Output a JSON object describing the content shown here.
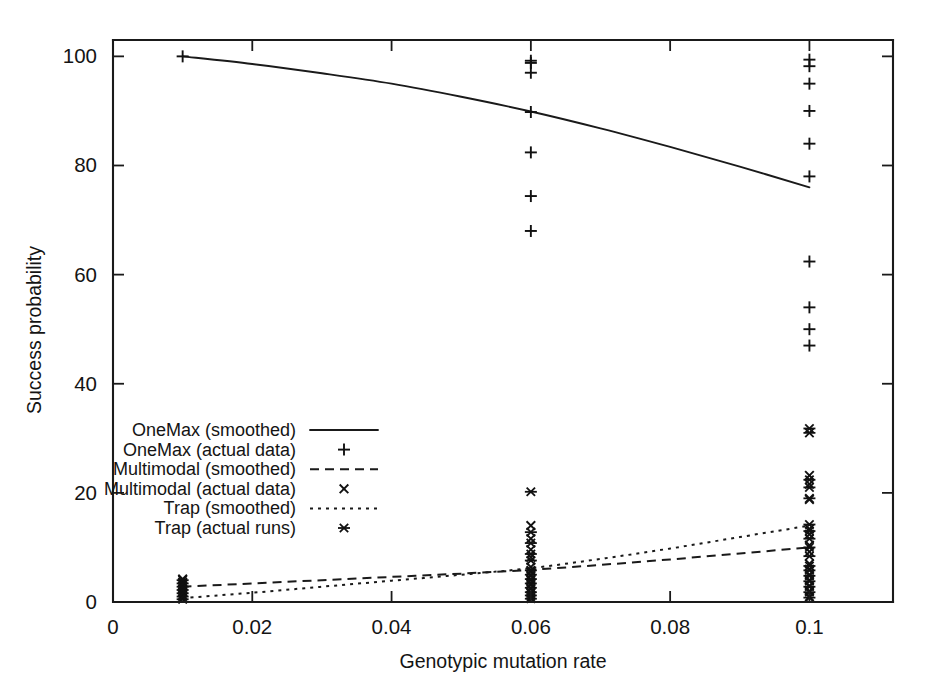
{
  "chart_data": {
    "type": "scatter",
    "title": "",
    "xlabel": "Genotypic mutation rate",
    "ylabel": "Success probability",
    "xlim": [
      0,
      0.112
    ],
    "ylim": [
      0,
      103
    ],
    "grid": false,
    "legend_position": "center-left",
    "xticks": [
      "0",
      "0.02",
      "0.04",
      "0.06",
      "0.08",
      "0.1"
    ],
    "xtick_values": [
      0,
      0.02,
      0.04,
      0.06,
      0.08,
      0.1
    ],
    "yticks": [
      "0",
      "20",
      "40",
      "60",
      "80",
      "100"
    ],
    "ytick_values": [
      0,
      20,
      40,
      60,
      80,
      100
    ],
    "x_levels": [
      0.01,
      0.06,
      0.1
    ],
    "series": [
      {
        "name": "OneMax (smoothed)",
        "style": "solid-line",
        "marker": "line",
        "x": [
          0.01,
          0.02,
          0.03,
          0.04,
          0.05,
          0.06,
          0.07,
          0.08,
          0.09,
          0.1
        ],
        "values": [
          100.0,
          98.6,
          96.9,
          95.0,
          92.6,
          89.9,
          86.8,
          83.4,
          79.8,
          76.0
        ]
      },
      {
        "name": "OneMax (actual data)",
        "style": "points",
        "marker": "plus",
        "points": [
          {
            "x": 0.01,
            "y": 100
          },
          {
            "x": 0.06,
            "y": 99.2
          },
          {
            "x": 0.06,
            "y": 98.8
          },
          {
            "x": 0.06,
            "y": 97.0
          },
          {
            "x": 0.06,
            "y": 89.8
          },
          {
            "x": 0.06,
            "y": 82.4
          },
          {
            "x": 0.06,
            "y": 74.4
          },
          {
            "x": 0.06,
            "y": 68.0
          },
          {
            "x": 0.1,
            "y": 99.4
          },
          {
            "x": 0.1,
            "y": 98.2
          },
          {
            "x": 0.1,
            "y": 95.0
          },
          {
            "x": 0.1,
            "y": 90.0
          },
          {
            "x": 0.1,
            "y": 84.0
          },
          {
            "x": 0.1,
            "y": 78.0
          },
          {
            "x": 0.1,
            "y": 62.4
          },
          {
            "x": 0.1,
            "y": 54.0
          },
          {
            "x": 0.1,
            "y": 50.0
          },
          {
            "x": 0.1,
            "y": 47.0
          }
        ]
      },
      {
        "name": "Multimodal (smoothed)",
        "style": "dashed-line",
        "marker": "line",
        "x": [
          0.01,
          0.02,
          0.03,
          0.04,
          0.05,
          0.06,
          0.07,
          0.08,
          0.09,
          0.1
        ],
        "values": [
          2.8,
          3.4,
          4.0,
          4.6,
          5.2,
          5.9,
          6.8,
          7.8,
          8.9,
          10.0
        ]
      },
      {
        "name": "Multimodal (actual data)",
        "style": "points",
        "marker": "cross",
        "points": [
          {
            "x": 0.01,
            "y": 0.6
          },
          {
            "x": 0.01,
            "y": 1.2
          },
          {
            "x": 0.01,
            "y": 1.8
          },
          {
            "x": 0.01,
            "y": 2.4
          },
          {
            "x": 0.01,
            "y": 3.0
          },
          {
            "x": 0.01,
            "y": 3.6
          },
          {
            "x": 0.01,
            "y": 4.2
          },
          {
            "x": 0.06,
            "y": 0.8
          },
          {
            "x": 0.06,
            "y": 1.6
          },
          {
            "x": 0.06,
            "y": 2.4
          },
          {
            "x": 0.06,
            "y": 3.2
          },
          {
            "x": 0.06,
            "y": 4.0
          },
          {
            "x": 0.06,
            "y": 4.8
          },
          {
            "x": 0.06,
            "y": 5.6
          },
          {
            "x": 0.06,
            "y": 6.4
          },
          {
            "x": 0.06,
            "y": 8.2
          },
          {
            "x": 0.06,
            "y": 9.6
          },
          {
            "x": 0.06,
            "y": 11.6
          },
          {
            "x": 0.06,
            "y": 14.0
          },
          {
            "x": 0.1,
            "y": 1.0
          },
          {
            "x": 0.1,
            "y": 2.0
          },
          {
            "x": 0.1,
            "y": 3.0
          },
          {
            "x": 0.1,
            "y": 4.0
          },
          {
            "x": 0.1,
            "y": 5.0
          },
          {
            "x": 0.1,
            "y": 6.0
          },
          {
            "x": 0.1,
            "y": 7.0
          },
          {
            "x": 0.1,
            "y": 9.2
          },
          {
            "x": 0.1,
            "y": 10.4
          },
          {
            "x": 0.1,
            "y": 12.4
          },
          {
            "x": 0.1,
            "y": 13.4
          },
          {
            "x": 0.1,
            "y": 18.8
          },
          {
            "x": 0.1,
            "y": 21.6
          },
          {
            "x": 0.1,
            "y": 23.2
          }
        ]
      },
      {
        "name": "Trap (smoothed)",
        "style": "dotted-line",
        "marker": "line",
        "x": [
          0.01,
          0.02,
          0.03,
          0.04,
          0.05,
          0.06,
          0.07,
          0.08,
          0.09,
          0.1
        ],
        "values": [
          0.7,
          1.7,
          2.8,
          3.9,
          5.0,
          6.2,
          7.9,
          9.8,
          11.9,
          14.0
        ]
      },
      {
        "name": "Trap (actual runs)",
        "style": "points",
        "marker": "star",
        "points": [
          {
            "x": 0.01,
            "y": 0.5
          },
          {
            "x": 0.01,
            "y": 1.0
          },
          {
            "x": 0.01,
            "y": 1.6
          },
          {
            "x": 0.01,
            "y": 2.2
          },
          {
            "x": 0.01,
            "y": 2.8
          },
          {
            "x": 0.01,
            "y": 3.4
          },
          {
            "x": 0.01,
            "y": 4.0
          },
          {
            "x": 0.06,
            "y": 0.6
          },
          {
            "x": 0.06,
            "y": 1.2
          },
          {
            "x": 0.06,
            "y": 1.8
          },
          {
            "x": 0.06,
            "y": 2.6
          },
          {
            "x": 0.06,
            "y": 3.4
          },
          {
            "x": 0.06,
            "y": 4.2
          },
          {
            "x": 0.06,
            "y": 5.0
          },
          {
            "x": 0.06,
            "y": 5.8
          },
          {
            "x": 0.06,
            "y": 7.6
          },
          {
            "x": 0.06,
            "y": 8.8
          },
          {
            "x": 0.06,
            "y": 10.8
          },
          {
            "x": 0.06,
            "y": 12.8
          },
          {
            "x": 0.06,
            "y": 20.2
          },
          {
            "x": 0.1,
            "y": 0.8
          },
          {
            "x": 0.1,
            "y": 1.8
          },
          {
            "x": 0.1,
            "y": 2.8
          },
          {
            "x": 0.1,
            "y": 3.8
          },
          {
            "x": 0.1,
            "y": 4.8
          },
          {
            "x": 0.1,
            "y": 5.8
          },
          {
            "x": 0.1,
            "y": 6.6
          },
          {
            "x": 0.1,
            "y": 8.4
          },
          {
            "x": 0.1,
            "y": 10.0
          },
          {
            "x": 0.1,
            "y": 11.6
          },
          {
            "x": 0.1,
            "y": 13.0
          },
          {
            "x": 0.1,
            "y": 14.2
          },
          {
            "x": 0.1,
            "y": 19.0
          },
          {
            "x": 0.1,
            "y": 21.0
          },
          {
            "x": 0.1,
            "y": 22.4
          },
          {
            "x": 0.1,
            "y": 31.0
          },
          {
            "x": 0.1,
            "y": 31.8
          }
        ]
      }
    ],
    "legend_entries": [
      {
        "label": "OneMax (smoothed)",
        "marker": "solid-line"
      },
      {
        "label": "OneMax (actual data)",
        "marker": "plus"
      },
      {
        "label": "Multimodal (smoothed)",
        "marker": "dashed-line"
      },
      {
        "label": "Multimodal (actual data)",
        "marker": "cross"
      },
      {
        "label": "Trap (smoothed)",
        "marker": "dotted-line"
      },
      {
        "label": "Trap (actual runs)",
        "marker": "star"
      }
    ]
  }
}
